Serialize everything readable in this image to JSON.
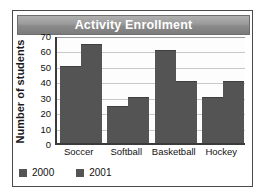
{
  "chart_data": {
    "type": "bar",
    "title": "Activity Enrollment",
    "xlabel": "",
    "ylabel": "Number of students",
    "categories": [
      "Soccer",
      "Softball",
      "Basketball",
      "Hockey"
    ],
    "series": [
      {
        "name": "2000",
        "values": [
          50,
          24,
          60,
          30
        ],
        "color": "#545454"
      },
      {
        "name": "2001",
        "values": [
          64,
          30,
          40,
          40
        ],
        "color": "#545454"
      }
    ],
    "ylim": [
      0,
      70
    ],
    "ytick_step": 10,
    "yticks": [
      0,
      10,
      20,
      30,
      40,
      50,
      60,
      70
    ],
    "ytick_labels": [
      "0",
      "10",
      "20",
      "30",
      "40",
      "50",
      "60",
      "70"
    ],
    "grid": true,
    "grid_axis": "y",
    "legend_position": "bottom-left",
    "legend": [
      "2000",
      "2001"
    ]
  },
  "style": {
    "title_bar_text_color": "#ffffff",
    "title_bar_color": "#9a9a9a",
    "bar_color": "#545454",
    "gridline_color": "#c9c9c9",
    "axis_color": "#3b3b3b",
    "border_color": "#4a4a4a",
    "plot_background": "#fdfdfd"
  }
}
